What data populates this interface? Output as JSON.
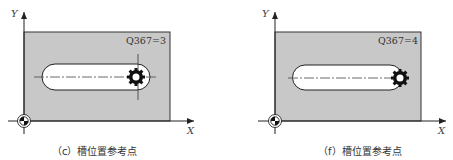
{
  "figures": [
    {
      "id": "c",
      "caption": "（c）槽位置参考点",
      "parameter_label": "Q367=3",
      "axis_x_label": "X",
      "axis_y_label": "Y",
      "reference_point": "slot-end-center-right"
    },
    {
      "id": "f",
      "caption": "（f）槽位置参考点",
      "parameter_label": "Q367=4",
      "axis_x_label": "X",
      "axis_y_label": "Y",
      "reference_point": "slot-end-right-edge"
    }
  ],
  "colors": {
    "workpiece_fill": "#c8c8c8",
    "slot_fill": "#ffffff",
    "line": "#222222"
  }
}
